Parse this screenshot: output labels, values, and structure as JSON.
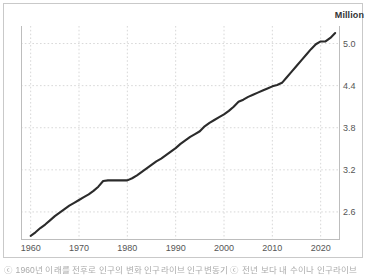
{
  "unit_label": "Million",
  "caption": "ⓒ 1960년 이래를 전후로 인구의 변화 인구라이브 인구변동기 ⓒ 전년 보다 내 수이나 인구라이브",
  "colors": {
    "line": "#2b2b2b",
    "grid": "#d8d8d8",
    "axis": "#bdbdbd",
    "frame": "#c9c9c9",
    "tick_text": "#555555",
    "unit_text": "#333333",
    "background": "#ffffff"
  },
  "chart_data": {
    "type": "line",
    "title": "",
    "subtitle": "",
    "xlabel": "",
    "ylabel": "Million",
    "unit": "Million",
    "grid": true,
    "legend": false,
    "legend_position": "none",
    "xlim": [
      1958,
      2024
    ],
    "ylim": [
      2.2,
      5.25
    ],
    "xticks": [
      1960,
      1970,
      1980,
      1990,
      2000,
      2010,
      2020
    ],
    "xtick_labels": [
      "1960",
      "1970",
      "1980",
      "1990",
      "2000",
      "2010",
      "2020"
    ],
    "yticks": [
      2.6,
      3.2,
      3.8,
      4.4,
      5.0
    ],
    "ytick_labels": [
      "2.6",
      "3.2",
      "3.8",
      "4.4",
      "5.0"
    ],
    "series": [
      {
        "name": "Population",
        "x": [
          1960,
          1961,
          1962,
          1963,
          1964,
          1965,
          1966,
          1967,
          1968,
          1969,
          1970,
          1971,
          1972,
          1973,
          1974,
          1975,
          1976,
          1977,
          1978,
          1979,
          1980,
          1981,
          1982,
          1983,
          1984,
          1985,
          1986,
          1987,
          1988,
          1989,
          1990,
          1991,
          1992,
          1993,
          1994,
          1995,
          1996,
          1997,
          1998,
          1999,
          2000,
          2001,
          2002,
          2003,
          2004,
          2005,
          2006,
          2007,
          2008,
          2009,
          2010,
          2011,
          2012,
          2013,
          2014,
          2015,
          2016,
          2017,
          2018,
          2019,
          2020,
          2021,
          2022,
          2023
        ],
        "values": [
          2.26,
          2.31,
          2.37,
          2.42,
          2.48,
          2.54,
          2.59,
          2.64,
          2.69,
          2.73,
          2.77,
          2.81,
          2.85,
          2.9,
          2.96,
          3.04,
          3.05,
          3.05,
          3.05,
          3.05,
          3.05,
          3.08,
          3.12,
          3.17,
          3.22,
          3.27,
          3.32,
          3.36,
          3.41,
          3.46,
          3.51,
          3.57,
          3.62,
          3.67,
          3.71,
          3.75,
          3.82,
          3.87,
          3.91,
          3.95,
          3.99,
          4.04,
          4.1,
          4.17,
          4.2,
          4.24,
          4.27,
          4.3,
          4.33,
          4.36,
          4.39,
          4.41,
          4.44,
          4.52,
          4.6,
          4.68,
          4.76,
          4.84,
          4.92,
          4.99,
          5.03,
          5.03,
          5.08,
          5.15
        ]
      }
    ]
  }
}
